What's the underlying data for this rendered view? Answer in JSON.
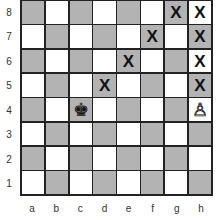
{
  "board": {
    "ranks": [
      "8",
      "7",
      "6",
      "5",
      "4",
      "3",
      "2",
      "1"
    ],
    "files": [
      "a",
      "b",
      "c",
      "d",
      "e",
      "f",
      "g",
      "h"
    ],
    "colors": {
      "light": "#ffffff",
      "dark": "#b3b3b3",
      "line": "#222222"
    },
    "pieces": [
      {
        "square": "c4",
        "piece": "king",
        "color": "black",
        "glyph": "♚"
      },
      {
        "square": "h4",
        "piece": "pawn",
        "color": "white",
        "glyph": "♙"
      }
    ],
    "marks": [
      {
        "square": "g8",
        "text": "X"
      },
      {
        "square": "h8",
        "text": "X"
      },
      {
        "square": "f7",
        "text": "X"
      },
      {
        "square": "h7",
        "text": "X"
      },
      {
        "square": "e6",
        "text": "X"
      },
      {
        "square": "h6",
        "text": "X"
      },
      {
        "square": "d5",
        "text": "X"
      },
      {
        "square": "h5",
        "text": "X"
      }
    ]
  }
}
